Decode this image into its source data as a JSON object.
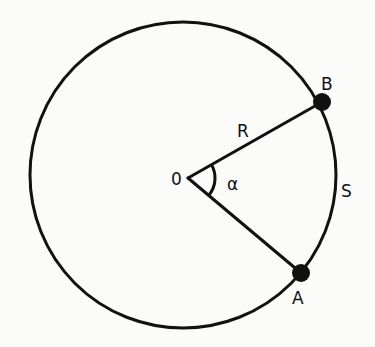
{
  "diagram": {
    "type": "circle-arc-geometry",
    "colors": {
      "stroke": "#111111",
      "background": "#fbfbfa"
    },
    "circle": {
      "cx": 183,
      "cy": 175,
      "r": 153
    },
    "center_point": {
      "label": "0",
      "x": 188,
      "y": 178
    },
    "points": [
      {
        "id": "B",
        "label": "B",
        "x": 322,
        "y": 102
      },
      {
        "id": "A",
        "label": "A",
        "x": 301,
        "y": 273
      }
    ],
    "segments": [
      {
        "from": "O",
        "to": "B",
        "label": "R"
      },
      {
        "from": "O",
        "to": "A",
        "label": ""
      }
    ],
    "angle": {
      "label": "α",
      "vertex": "O",
      "between": [
        "B",
        "A"
      ],
      "arc_radius": 27
    },
    "arc": {
      "label": "S",
      "from": "A",
      "to": "B"
    },
    "labels": {
      "center": "0",
      "radius": "R",
      "angle": "α",
      "arc_length": "S",
      "point_a": "A",
      "point_b": "B"
    }
  }
}
